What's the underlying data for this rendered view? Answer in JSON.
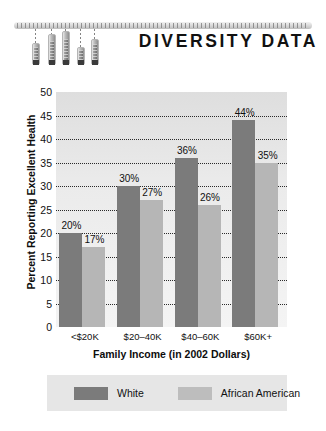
{
  "header": {
    "title": "DIVERSITY DATA",
    "graphic": {
      "name": "thermometer-ruler-graphic",
      "ruler_label": "ruler-bar",
      "bars": [
        {
          "left": 32,
          "drop": 14,
          "height": 22
        },
        {
          "left": 48,
          "drop": 5,
          "height": 31
        },
        {
          "left": 62,
          "drop": 2,
          "height": 34
        },
        {
          "left": 77,
          "drop": 18,
          "height": 18
        },
        {
          "left": 91,
          "drop": 10,
          "height": 26
        }
      ]
    }
  },
  "chart_data": {
    "type": "bar",
    "title": "DIVERSITY DATA",
    "xlabel": "Family Income (in 2002 Dollars)",
    "ylabel": "Percent Reporting Excellent Health",
    "categories": [
      "<$20K",
      "$20–40K",
      "$40–60K",
      "$60K+"
    ],
    "series": [
      {
        "name": "White",
        "color": "#7b7b7b",
        "values": [
          20,
          30,
          36,
          44
        ],
        "labels": [
          "20%",
          "30%",
          "36%",
          "44%"
        ]
      },
      {
        "name": "African American",
        "color": "#b6b6b6",
        "values": [
          17,
          27,
          26,
          35
        ],
        "labels": [
          "17%",
          "27%",
          "26%",
          "35%"
        ]
      }
    ],
    "ylim": [
      0,
      50
    ],
    "yticks": [
      0,
      5,
      10,
      15,
      20,
      25,
      30,
      35,
      40,
      45,
      50
    ],
    "ytick_labels": [
      "0",
      "5",
      "10",
      "15",
      "20",
      "25",
      "30",
      "35",
      "40",
      "45",
      "50"
    ],
    "grid": true,
    "grid_style": "dotted",
    "legend_position": "bottom",
    "plot_background": "#e9e9e9"
  },
  "legend": {
    "entries": [
      {
        "label": "White",
        "color": "#7b7b7b"
      },
      {
        "label": "African American",
        "color": "#bdbdbd"
      }
    ]
  }
}
